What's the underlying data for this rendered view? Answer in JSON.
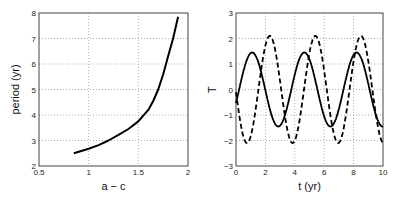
{
  "chart_data": [
    {
      "type": "line",
      "title": "",
      "xlabel": "a − c",
      "ylabel": "period (yr)",
      "xlim": [
        0.5,
        2
      ],
      "ylim": [
        2,
        8
      ],
      "xticks": [
        "0.5",
        "1",
        "1.5",
        "2"
      ],
      "yticks": [
        "2",
        "3",
        "4",
        "5",
        "6",
        "7",
        "8"
      ],
      "grid": true,
      "series": [
        {
          "name": "period",
          "style": "solid",
          "x": [
            0.85,
            1.0,
            1.1,
            1.2,
            1.3,
            1.4,
            1.5,
            1.6,
            1.65,
            1.7,
            1.75,
            1.8,
            1.85,
            1.9
          ],
          "y": [
            2.5,
            2.68,
            2.82,
            3.0,
            3.22,
            3.45,
            3.75,
            4.2,
            4.55,
            5.0,
            5.6,
            6.3,
            7.0,
            7.85
          ]
        }
      ]
    },
    {
      "type": "line",
      "title": "",
      "xlabel": "t (yr)",
      "ylabel": "T",
      "xlim": [
        0,
        10
      ],
      "ylim": [
        -3,
        3
      ],
      "xticks": [
        "0",
        "2",
        "4",
        "6",
        "8",
        "10"
      ],
      "yticks": [
        "−3",
        "−2",
        "−1",
        "0",
        "1",
        "2",
        "3"
      ],
      "grid": true,
      "series": [
        {
          "name": "solid",
          "style": "solid",
          "amplitude": 1.45,
          "period": 3.55,
          "value_at_0": -0.8,
          "peaks_t": [
            1.1,
            4.7,
            8.2
          ],
          "troughs_t": [
            3.0,
            6.5
          ]
        },
        {
          "name": "dashed",
          "style": "dashed",
          "amplitude": 2.1,
          "period": 3.1,
          "value_at_0": -0.8,
          "peaks_t": [
            2.3,
            5.4,
            8.5
          ],
          "troughs_t": [
            0.75,
            3.85,
            6.9
          ]
        }
      ]
    }
  ]
}
